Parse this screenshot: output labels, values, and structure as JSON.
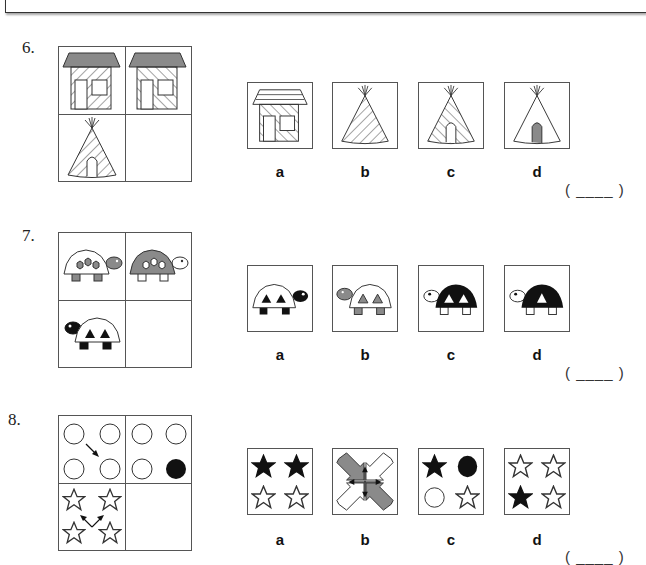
{
  "questions": [
    {
      "number": "6.",
      "matrix": [
        "house-hatched-forward",
        "house-hatched-back",
        "tepee-hatched-forward",
        "empty"
      ],
      "options": [
        {
          "label": "a",
          "figure": "house-striped-roof-hatched-back"
        },
        {
          "label": "b",
          "figure": "tepee-hatched-forward-no-door"
        },
        {
          "label": "c",
          "figure": "tepee-hatched-back"
        },
        {
          "label": "d",
          "figure": "tepee-plain-gray-door"
        }
      ],
      "answer_blank": "( ____ )"
    },
    {
      "number": "7.",
      "matrix": [
        "turtle-white-shell-gray-hexagons",
        "turtle-gray-shell-white-hexagons",
        "turtle-white-shell-black-triangles",
        "empty"
      ],
      "options": [
        {
          "label": "a",
          "figure": "turtle-white-shell-black-triangles-facing-right"
        },
        {
          "label": "b",
          "figure": "turtle-white-shell-gray-triangles-facing-left"
        },
        {
          "label": "c",
          "figure": "turtle-black-shell-two-white-triangles"
        },
        {
          "label": "d",
          "figure": "turtle-black-shell-one-white-triangle"
        }
      ],
      "answer_blank": "( ____ )"
    },
    {
      "number": "8.",
      "matrix": [
        "four-circles-diagonal-arrow",
        "four-circles-one-black",
        "four-stars-up-arrows",
        "empty"
      ],
      "options": [
        {
          "label": "a",
          "figure": "two-black-stars-top-two-white-bottom"
        },
        {
          "label": "b",
          "figure": "four-arrows-converging-cross"
        },
        {
          "label": "c",
          "figure": "black-star-black-circle-white-circle-white-star"
        },
        {
          "label": "d",
          "figure": "three-white-stars-one-black-bottom-left"
        }
      ],
      "answer_blank": "( ____ )"
    }
  ],
  "colors": {
    "gray_fill": "#8a8a8a",
    "black_fill": "#111111",
    "line": "#333333"
  }
}
